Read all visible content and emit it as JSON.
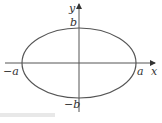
{
  "diagram": {
    "type": "ellipse-on-axes",
    "colors": {
      "stroke": "#555555",
      "text": "#333333"
    },
    "axes": {
      "x_label": "x",
      "y_label": "y"
    },
    "points": {
      "right_vertex": "a",
      "left_vertex": "−a",
      "top_covertex": "b",
      "bottom_covertex": "−b"
    },
    "ellipse": {
      "cx": 79,
      "cy": 63,
      "rx": 57,
      "ry": 35
    }
  }
}
